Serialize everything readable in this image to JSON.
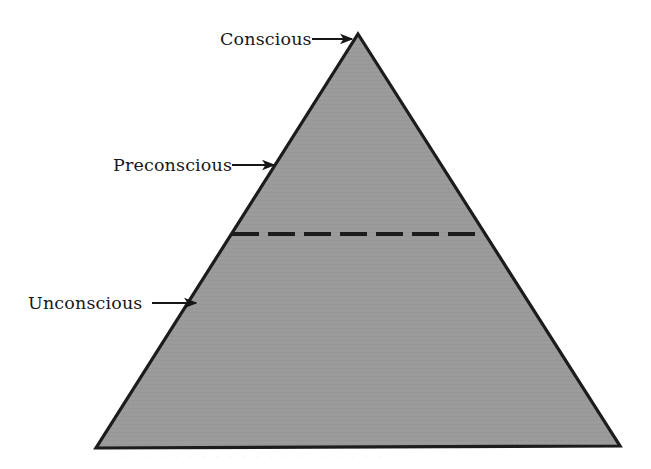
{
  "figure": {
    "background_color": "#ffffff",
    "fill_color": "#9a9a9a",
    "outline_color": "#1a1a1a",
    "text_color": "#171717"
  },
  "triangle": {
    "apex": {
      "x": 358,
      "y": 34
    },
    "base_left": {
      "x": 96,
      "y": 448
    },
    "base_right": {
      "x": 620,
      "y": 446
    },
    "outline_width": 3
  },
  "divider": {
    "name": "dashed-divider",
    "y": 234,
    "x_start": 232,
    "x_end": 486,
    "dash_count": 7,
    "stroke_width": 4,
    "color": "#1a1a1a"
  },
  "labels": [
    {
      "id": "conscious",
      "text": "Conscious",
      "text_x": 220,
      "text_baseline_y": 45,
      "arrow_x1": 312,
      "arrow_x2": 352,
      "arrow_y": 39
    },
    {
      "id": "preconscious",
      "text": "Preconscious",
      "text_x": 113,
      "text_baseline_y": 171,
      "arrow_x1": 232,
      "arrow_x2": 274,
      "arrow_y": 165
    },
    {
      "id": "unconscious",
      "text": "Unconscious",
      "text_x": 28,
      "text_baseline_y": 309,
      "arrow_x1": 152,
      "arrow_x2": 196,
      "arrow_y": 303
    }
  ],
  "regions": [
    {
      "id": "conscious-region",
      "label": "Conscious"
    },
    {
      "id": "preconscious-region",
      "label": "Preconscious"
    },
    {
      "id": "unconscious-region",
      "label": "Unconscious"
    }
  ],
  "ghost_bleed": {
    "visible": true,
    "text": "· · · · · · · · · · · · · · · · · · · ·",
    "y": 460
  }
}
